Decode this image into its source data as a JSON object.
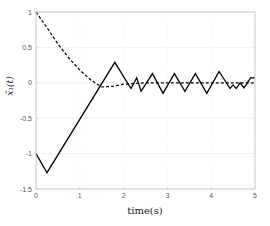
{
  "chart_data": {
    "type": "line",
    "title": "",
    "xlabel": "time(s)",
    "ylabel": "x̃₁(t)",
    "xlim": [
      0,
      5
    ],
    "ylim": [
      -1.5,
      1
    ],
    "grid": true,
    "legend": null,
    "x_ticks": [
      0,
      1,
      2,
      3,
      4,
      5
    ],
    "x_tick_labels": [
      "0",
      "1",
      "2",
      "3",
      "4",
      "5"
    ],
    "y_ticks": [
      -1.5,
      -1,
      -0.5,
      0,
      0.5,
      1
    ],
    "y_tick_labels": [
      "-1.5",
      "-1",
      "-0.5",
      "0",
      "0.5",
      "1"
    ],
    "series": [
      {
        "name": "solid",
        "style": "solid",
        "color": "#000000",
        "x": [
          0,
          0.25,
          1.8,
          2.17,
          2.3,
          2.4,
          2.66,
          2.9,
          3.16,
          3.4,
          3.64,
          3.9,
          4.18,
          4.43,
          4.5,
          4.57,
          4.66,
          4.75,
          4.9,
          5.0
        ],
        "y": [
          -1.0,
          -1.27,
          0.29,
          -0.08,
          0.07,
          -0.12,
          0.13,
          -0.15,
          0.13,
          -0.12,
          0.13,
          -0.15,
          0.16,
          -0.08,
          -0.03,
          -0.08,
          0.0,
          -0.07,
          0.07,
          0.07
        ]
      },
      {
        "name": "dashed",
        "style": "dashed",
        "color": "#000000",
        "x": [
          0,
          0.25,
          0.5,
          0.75,
          1.0,
          1.25,
          1.5,
          1.75,
          2.0,
          2.5,
          3.0,
          3.5,
          4.0,
          4.5,
          5.0
        ],
        "y": [
          1.0,
          0.78,
          0.55,
          0.35,
          0.18,
          0.04,
          -0.06,
          -0.05,
          -0.02,
          0.0,
          0.0,
          0.0,
          0.0,
          0.0,
          0.0
        ]
      }
    ]
  },
  "colors": {
    "axis": "#bdbdbd",
    "grid": "#e8e8e8",
    "line": "#000000"
  }
}
